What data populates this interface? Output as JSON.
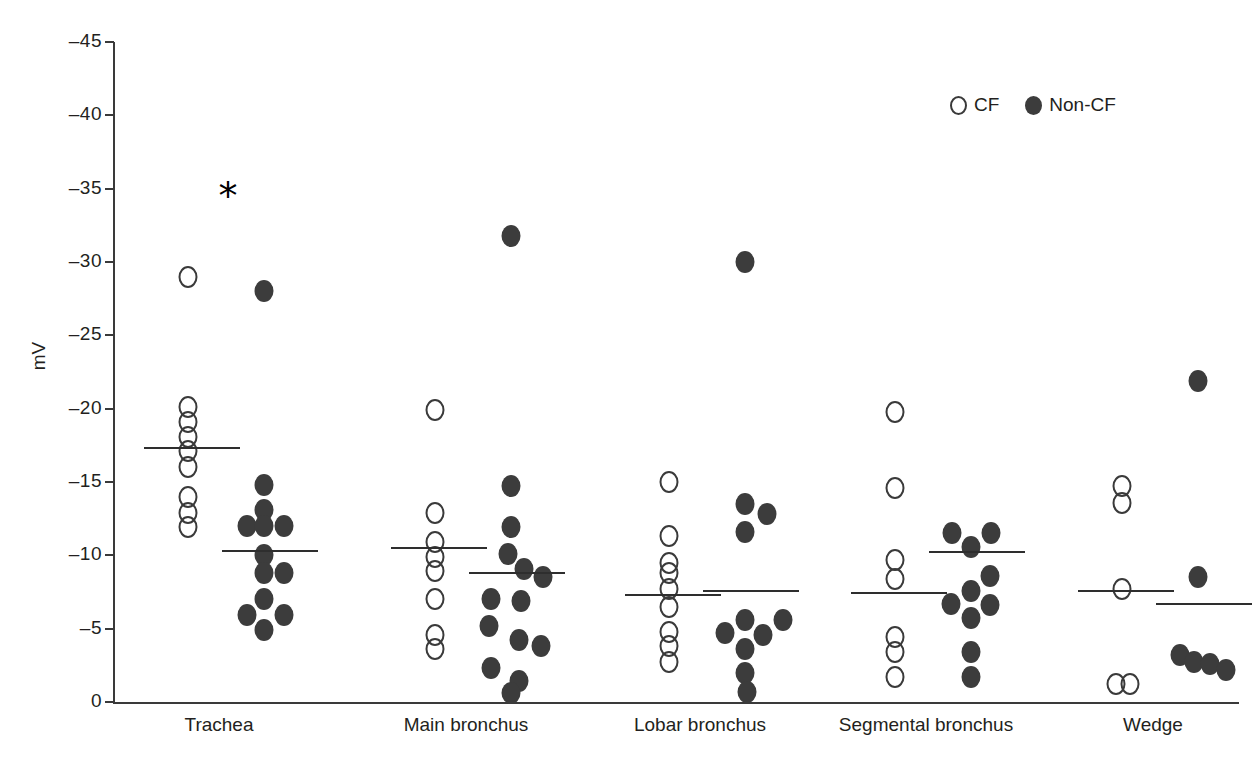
{
  "chart_data": {
    "type": "scatter",
    "title": "",
    "xlabel": "",
    "ylabel": "mV",
    "ylim": [
      -45,
      0
    ],
    "ytick_labels": [
      "–45",
      "–40",
      "–35",
      "–30",
      "–25",
      "–20",
      "–15",
      "–10",
      "–5",
      "0"
    ],
    "ytick_values": [
      -45,
      -40,
      -35,
      -30,
      -25,
      -20,
      -15,
      -10,
      -5,
      0
    ],
    "grid": false,
    "legend_position": "top-right",
    "legend": [
      {
        "key": "cf",
        "label": "CF",
        "marker": "open-circle",
        "color": "#3a3a3a"
      },
      {
        "key": "noncf",
        "label": "Non-CF",
        "marker": "filled-circle",
        "color": "#3c3c3c"
      }
    ],
    "annotations": [
      {
        "text": "*",
        "category": "Trachea",
        "value": -34.5,
        "meaning": "significant-difference"
      }
    ],
    "categories": [
      "Trachea",
      "Main bronchus",
      "Lobar bronchus",
      "Segmental bronchus",
      "Wedge"
    ],
    "groups": [
      {
        "category": "Trachea",
        "series": [
          {
            "name": "CF",
            "mean": -17.3,
            "values": [
              -29.0,
              -20.1,
              -19.1,
              -18.1,
              -17.1,
              -16.0,
              -14.0,
              -12.9,
              -11.9
            ],
            "offsets": [
              0,
              0,
              0,
              0,
              0,
              0,
              0,
              0,
              0
            ]
          },
          {
            "name": "Non-CF",
            "mean": -10.3,
            "values": [
              -28.0,
              -14.8,
              -13.1,
              -12.0,
              -12.0,
              -12.0,
              -10.0,
              -8.8,
              -8.8,
              -7.0,
              -5.9,
              -5.9,
              -4.9
            ],
            "offsets": [
              0,
              0,
              0,
              -17,
              20,
              0,
              0,
              0,
              20,
              0,
              -17,
              20,
              0
            ]
          }
        ]
      },
      {
        "category": "Main bronchus",
        "series": [
          {
            "name": "CF",
            "mean": -10.5,
            "values": [
              -19.9,
              -12.9,
              -10.9,
              -9.9,
              -8.9,
              -7.0,
              -4.6,
              -3.6
            ],
            "offsets": [
              0,
              0,
              0,
              0,
              0,
              0,
              0,
              0
            ]
          },
          {
            "name": "Non-CF",
            "mean": -8.8,
            "values": [
              -31.8,
              -14.7,
              -11.9,
              -10.1,
              -9.1,
              -8.5,
              -7.0,
              -6.9,
              -5.2,
              -4.2,
              -3.8,
              -2.3,
              -1.4,
              -0.6
            ],
            "offsets": [
              0,
              0,
              0,
              -3,
              13,
              32,
              -20,
              10,
              -22,
              8,
              30,
              -20,
              8,
              0
            ]
          }
        ]
      },
      {
        "category": "Lobar bronchus",
        "series": [
          {
            "name": "CF",
            "mean": -7.3,
            "values": [
              -15.0,
              -11.3,
              -9.5,
              -8.8,
              -7.7,
              -6.5,
              -4.8,
              -3.8,
              -2.7
            ],
            "offsets": [
              0,
              0,
              0,
              0,
              0,
              0,
              0,
              0,
              0
            ]
          },
          {
            "name": "Non-CF",
            "mean": -7.6,
            "values": [
              -30.0,
              -13.5,
              -12.8,
              -11.6,
              -5.6,
              -5.6,
              -4.7,
              -4.6,
              -3.6,
              -2.0,
              -0.7
            ],
            "offsets": [
              0,
              0,
              22,
              0,
              0,
              38,
              -20,
              18,
              0,
              0,
              2
            ]
          }
        ]
      },
      {
        "category": "Segmental bronchus",
        "series": [
          {
            "name": "CF",
            "mean": -7.4,
            "values": [
              -19.8,
              -14.6,
              -9.7,
              -8.4,
              -4.4,
              -3.4,
              -1.7
            ],
            "offsets": [
              0,
              0,
              0,
              0,
              0,
              0,
              0
            ]
          },
          {
            "name": "Non-CF",
            "mean": -10.2,
            "values": [
              -11.5,
              -11.5,
              -10.6,
              -8.6,
              -7.6,
              -6.7,
              -6.6,
              -5.7,
              -3.4,
              -1.7
            ],
            "offsets": [
              -19,
              20,
              0,
              19,
              0,
              -20,
              19,
              0,
              0,
              0
            ]
          }
        ]
      },
      {
        "category": "Wedge",
        "series": [
          {
            "name": "CF",
            "mean": -7.6,
            "values": [
              -14.7,
              -13.6,
              -7.7,
              -1.2,
              -1.2
            ],
            "offsets": [
              0,
              0,
              0,
              -6,
              8
            ]
          },
          {
            "name": "Non-CF",
            "mean": -6.7,
            "values": [
              -21.9,
              -8.5,
              -3.2,
              -2.7,
              -2.6,
              -2.2
            ],
            "offsets": [
              0,
              0,
              -18,
              -4,
              12,
              28
            ]
          }
        ]
      }
    ]
  },
  "axis": {
    "y_title": "mV"
  }
}
